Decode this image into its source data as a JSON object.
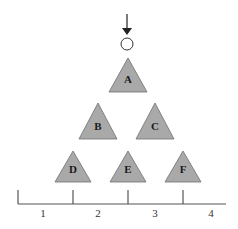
{
  "diagram": {
    "colors": {
      "triangle_fill": "#a9a9a9",
      "triangle_stroke": "#6e6e6e",
      "line": "#555555",
      "arrow": "#222222",
      "circle_fill": "#ffffff",
      "circle_stroke": "#333333"
    },
    "entry": {
      "arrow": "down-arrow",
      "marker": "circle"
    },
    "nodes": [
      {
        "label": "A",
        "row": 1,
        "cx": 128,
        "apex_y": 58,
        "base_y": 92,
        "half_w": 19
      },
      {
        "label": "B",
        "row": 2,
        "cx": 98,
        "apex_y": 103,
        "base_y": 139,
        "half_w": 19
      },
      {
        "label": "C",
        "row": 2,
        "cx": 155,
        "apex_y": 103,
        "base_y": 139,
        "half_w": 19
      },
      {
        "label": "D",
        "row": 3,
        "cx": 73,
        "apex_y": 151,
        "base_y": 182,
        "half_w": 18
      },
      {
        "label": "E",
        "row": 3,
        "cx": 128,
        "apex_y": 151,
        "base_y": 182,
        "half_w": 18
      },
      {
        "label": "F",
        "row": 3,
        "cx": 183,
        "apex_y": 151,
        "base_y": 182,
        "half_w": 18
      }
    ],
    "axis": {
      "ticks": [
        {
          "x": 18
        },
        {
          "x": 73
        },
        {
          "x": 128
        },
        {
          "x": 183
        }
      ],
      "segment_labels": [
        {
          "text": "1",
          "x": 43
        },
        {
          "text": "2",
          "x": 98
        },
        {
          "text": "3",
          "x": 155
        },
        {
          "text": "4",
          "x": 211
        }
      ]
    }
  }
}
